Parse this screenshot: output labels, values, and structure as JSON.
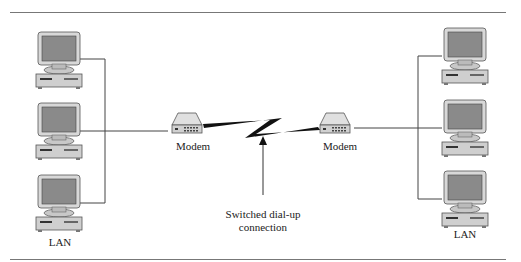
{
  "diagram": {
    "left_lan": {
      "label": "LAN",
      "computers": 3
    },
    "right_lan": {
      "label": "LAN",
      "computers": 3
    },
    "left_modem": {
      "label": "Modem"
    },
    "right_modem": {
      "label": "Modem"
    },
    "link": {
      "label_line1": "Switched dial-up",
      "label_line2": "connection"
    }
  }
}
